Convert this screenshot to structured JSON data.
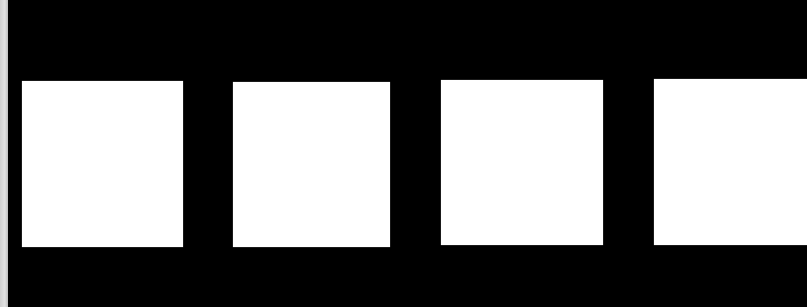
{
  "scene": {
    "background_color": "#000000",
    "edge_strip_color": "#d6d6d6",
    "square_color": "#ffffff",
    "squares": [
      {
        "x": 22,
        "y": 81,
        "w": 161,
        "h": 166
      },
      {
        "x": 233,
        "y": 82,
        "w": 157,
        "h": 165
      },
      {
        "x": 441,
        "y": 80,
        "w": 162,
        "h": 165
      },
      {
        "x": 654,
        "y": 79,
        "w": 153,
        "h": 166
      }
    ]
  }
}
